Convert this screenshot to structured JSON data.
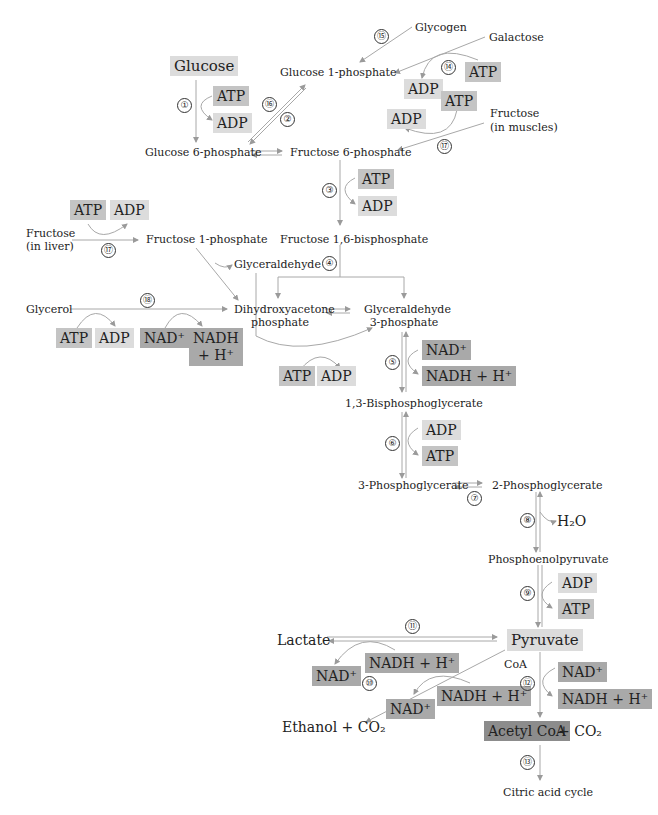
{
  "metabolites": {
    "glucose": "Glucose",
    "glycogen": "Glycogen",
    "galactose": "Galactose",
    "g1p": "Glucose 1-phosphate",
    "g6p": "Glucose 6-phosphate",
    "f6p": "Fructose 6-phosphate",
    "fructose_muscle_1": "Fructose",
    "fructose_muscle_2": "(in muscles)",
    "fructose_liver_1": "Fructose",
    "fructose_liver_2": "(in liver)",
    "f1p": "Fructose 1-phosphate",
    "f16bp": "Fructose 1,6-bisphosphate",
    "glyceraldehyde": "Glyceraldehyde",
    "glycerol": "Glycerol",
    "dhap_1": "Dihydroxyacetone",
    "dhap_2": "phosphate",
    "gap_1": "Glyceraldehyde",
    "gap_2": "3-phosphate",
    "bpg": "1,3-Bisphosphoglycerate",
    "pg3": "3-Phosphoglycerate",
    "pg2": "2-Phosphoglycerate",
    "h2o": "H₂O",
    "pep": "Phosphoenolpyruvate",
    "pyruvate": "Pyruvate",
    "lactate": "Lactate",
    "coa": "CoA",
    "ethanol": "Ethanol + CO₂",
    "acetyl_coa": "Acetyl CoA",
    "acetyl_co2": "+ CO₂",
    "citric": "Citric acid cycle"
  },
  "cofactors": {
    "atp": "ATP",
    "adp": "ADP",
    "nad": "NAD⁺",
    "nadh": "NADH + H⁺",
    "nadh_1": "NADH",
    "nadh_2": "+ H⁺"
  },
  "steps": [
    "①",
    "②",
    "③",
    "④",
    "⑤",
    "⑥",
    "⑦",
    "⑧",
    "⑨",
    "⑩",
    "⑪",
    "⑫",
    "⑬",
    "⑭",
    "⑮",
    "⑯",
    "⑰",
    "⑱"
  ]
}
